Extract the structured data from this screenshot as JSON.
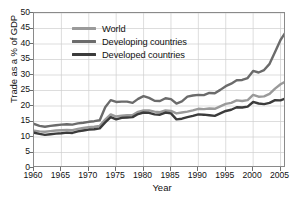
{
  "chart_data": {
    "type": "line",
    "title": "",
    "xlabel": "Year",
    "ylabel": "Trade as a % of GDP",
    "xlim": [
      1960,
      2006
    ],
    "ylim": [
      0,
      50
    ],
    "grid": true,
    "legend_position": "upper-left-inside",
    "xticks": [
      1960,
      1965,
      1970,
      1975,
      1980,
      1985,
      1990,
      1995,
      2000,
      2005
    ],
    "yticks": [
      0,
      5,
      10,
      15,
      20,
      25,
      30,
      35,
      40,
      45,
      50
    ],
    "x": [
      1960,
      1961,
      1962,
      1963,
      1964,
      1965,
      1966,
      1967,
      1968,
      1969,
      1970,
      1971,
      1972,
      1973,
      1974,
      1975,
      1976,
      1977,
      1978,
      1979,
      1980,
      1981,
      1982,
      1983,
      1984,
      1985,
      1986,
      1987,
      1988,
      1989,
      1990,
      1991,
      1992,
      1993,
      1994,
      1995,
      1996,
      1997,
      1998,
      1999,
      2000,
      2001,
      2002,
      2003,
      2004,
      2005,
      2006
    ],
    "series": [
      {
        "name": "World",
        "color": "#9a9a9a",
        "values": [
          12.0,
          11.8,
          11.7,
          11.9,
          12.1,
          12.2,
          12.3,
          12.2,
          12.6,
          12.9,
          13.2,
          13.3,
          13.6,
          15.6,
          17.3,
          16.6,
          16.9,
          17.0,
          17.1,
          18.1,
          18.6,
          18.6,
          18.2,
          18.0,
          18.6,
          18.4,
          17.6,
          17.9,
          18.2,
          18.6,
          19.1,
          19.0,
          19.2,
          19.1,
          19.9,
          20.7,
          21.0,
          21.8,
          21.6,
          21.9,
          23.6,
          23.0,
          23.1,
          23.9,
          25.6,
          27.0,
          28.0
        ]
      },
      {
        "name": "Developing countries",
        "color": "#6b6b6b",
        "values": [
          14.2,
          13.6,
          13.3,
          13.6,
          13.8,
          14.0,
          14.1,
          14.0,
          14.4,
          14.6,
          14.9,
          15.1,
          15.4,
          19.6,
          21.9,
          21.3,
          21.4,
          21.4,
          21.0,
          22.3,
          23.2,
          22.6,
          21.7,
          21.6,
          22.5,
          22.2,
          20.8,
          21.5,
          23.0,
          23.4,
          23.6,
          23.5,
          24.2,
          24.1,
          25.2,
          26.4,
          27.2,
          28.3,
          28.4,
          29.0,
          31.3,
          30.8,
          31.6,
          33.6,
          37.4,
          41.3,
          44.0
        ]
      },
      {
        "name": "Developed countries",
        "color": "#3b3b3b",
        "values": [
          11.4,
          11.0,
          10.7,
          10.9,
          11.1,
          11.2,
          11.4,
          11.3,
          11.8,
          12.1,
          12.4,
          12.5,
          12.8,
          14.7,
          16.4,
          15.7,
          16.2,
          16.3,
          16.4,
          17.4,
          17.9,
          17.8,
          17.3,
          17.2,
          17.9,
          17.6,
          15.7,
          15.9,
          16.4,
          16.8,
          17.3,
          17.2,
          17.0,
          16.8,
          17.6,
          18.4,
          18.8,
          19.6,
          19.5,
          19.8,
          21.3,
          20.8,
          20.6,
          21.0,
          21.9,
          21.8,
          22.5
        ]
      }
    ]
  },
  "legend": {
    "items": [
      {
        "label": "World"
      },
      {
        "label": "Developing countries"
      },
      {
        "label": "Developed countries"
      }
    ]
  }
}
